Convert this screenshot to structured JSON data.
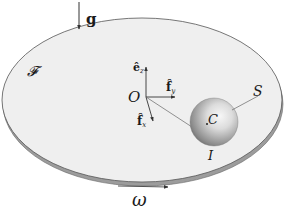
{
  "figure": {
    "type": "physics-diagram",
    "labels": {
      "gravity": "g",
      "frame": "𝓕",
      "origin": "O",
      "ez": "ê",
      "ez_sub": "z",
      "fy": "f̂",
      "fy_sub": "y",
      "fx": "f̂",
      "fx_sub": "x",
      "sphere_center": "C",
      "sphere": "S",
      "contact_point": "I",
      "angular_velocity": "ω"
    },
    "colors": {
      "disk_top": "#efefef",
      "disk_edge": "#9a9a9a",
      "outline": "#555555",
      "sphere_light": "#f4f4f4",
      "sphere_dark": "#6e6e6e",
      "text": "#1a1a1a"
    }
  }
}
